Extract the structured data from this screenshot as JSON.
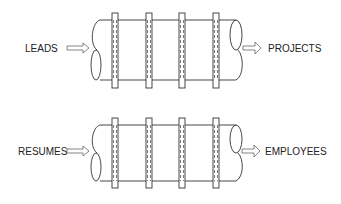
{
  "diagram": {
    "pipelines": [
      {
        "input_label": "LEADS",
        "output_label": "PROJECTS",
        "stages": 4
      },
      {
        "input_label": "RESUMES",
        "output_label": "EMPLOYEES",
        "stages": 4
      }
    ]
  }
}
